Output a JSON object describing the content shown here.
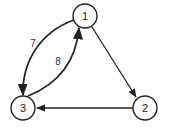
{
  "diagram": {
    "type": "directed-graph",
    "nodes": [
      {
        "id": "1",
        "label": "1",
        "cx": 85,
        "cy": 16
      },
      {
        "id": "2",
        "label": "2",
        "cx": 145,
        "cy": 108
      },
      {
        "id": "3",
        "label": "3",
        "cx": 23,
        "cy": 108
      }
    ],
    "edges": [
      {
        "from": "1",
        "to": "2",
        "label": ""
      },
      {
        "from": "2",
        "to": "3",
        "label": ""
      },
      {
        "from": "1",
        "to": "3",
        "label": "7"
      },
      {
        "from": "3",
        "to": "1",
        "label": "8"
      }
    ],
    "colors": {
      "stroke": "#222222",
      "background": "#ffffff"
    }
  }
}
